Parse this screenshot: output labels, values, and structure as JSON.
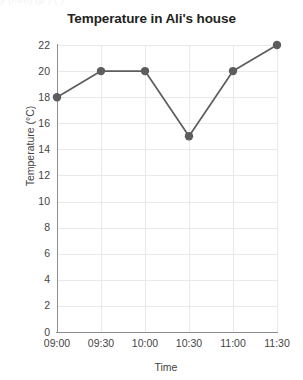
{
  "clipped_top_text": "y (mm) (p )  (   )",
  "chart_data": {
    "type": "line",
    "title": "Temperature in Ali's house",
    "xlabel": "Time",
    "ylabel": "Temperature (°C)",
    "categories": [
      "09:00",
      "09:30",
      "10:00",
      "10:30",
      "11:00",
      "11:30"
    ],
    "values": [
      18,
      20,
      20,
      15,
      20,
      22
    ],
    "series": [
      {
        "name": "Temperature",
        "values": [
          18,
          20,
          20,
          15,
          20,
          22
        ]
      }
    ],
    "ylim": [
      0,
      22
    ],
    "ytick_labels": [
      "0",
      "2",
      "4",
      "6",
      "8",
      "10",
      "12",
      "14",
      "16",
      "18",
      "20",
      "22"
    ],
    "ytick_values": [
      0,
      2,
      4,
      6,
      8,
      10,
      12,
      14,
      16,
      18,
      20,
      22
    ],
    "xtick_labels": [
      "09:00",
      "09:30",
      "10:00",
      "10:30",
      "11:00",
      "11:30"
    ],
    "grid": true,
    "legend": false,
    "marker": "circle",
    "colors": {
      "line": "#5d5d5f",
      "marker": "#5d5d5f",
      "grid": "#e9e9ea",
      "axis": "#8e8e90",
      "title_text": "#231f20",
      "label_text": "#3f3f3f",
      "background": "#ffffff"
    }
  }
}
